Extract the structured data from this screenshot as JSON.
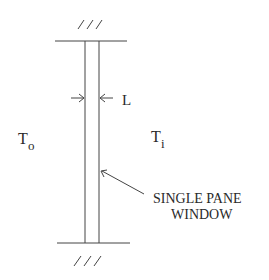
{
  "diagram": {
    "labels": {
      "thickness": "L",
      "outside_temp_main": "T",
      "outside_temp_sub": "o",
      "inside_temp_main": "T",
      "inside_temp_sub": "i",
      "callout_line1": "SINGLE PANE",
      "callout_line2": "WINDOW"
    },
    "colors": {
      "line": "#444444",
      "text": "#2a2a2a",
      "background": "#ffffff"
    }
  }
}
